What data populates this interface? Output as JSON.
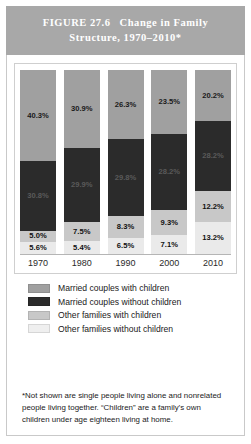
{
  "header": {
    "figure_number": "FIGURE 27.6",
    "title": "Change in Family Structure, 1970–2010*"
  },
  "chart_data": {
    "type": "bar",
    "subtype": "stacked-percent",
    "title": "Change in Family Structure, 1970–2010*",
    "xlabel": "",
    "ylabel": "",
    "ylim": [
      0,
      100
    ],
    "grid": false,
    "legend_position": "below",
    "categories": [
      "1970",
      "1980",
      "1990",
      "2000",
      "2010"
    ],
    "series": [
      {
        "name": "Married couples with children",
        "color": "#a0a0a0",
        "values": [
          40.3,
          30.9,
          26.3,
          23.5,
          20.2
        ],
        "labels": [
          "40.3%",
          "30.9%",
          "26.3%",
          "23.5%",
          "20.2%"
        ]
      },
      {
        "name": "Married couples without children",
        "color": "#2b2b2b",
        "values": [
          30.8,
          29.9,
          29.8,
          28.2,
          28.2
        ],
        "labels": [
          "30.8%",
          "29.9%",
          "29.8%",
          "28.2%",
          "28.2%"
        ]
      },
      {
        "name": "Other families with children",
        "color": "#c8c8c8",
        "values": [
          5.0,
          7.5,
          8.3,
          9.3,
          12.2
        ],
        "labels": [
          "5.0%",
          "7.5%",
          "8.3%",
          "9.3%",
          "12.2%"
        ]
      },
      {
        "name": "Other families without children",
        "color": "#eaeaea",
        "values": [
          5.6,
          5.4,
          6.5,
          7.1,
          13.2
        ],
        "labels": [
          "5.6%",
          "5.4%",
          "6.5%",
          "7.1%",
          "13.2%"
        ]
      }
    ]
  },
  "legend": {
    "items": [
      {
        "label": "Married couples with children"
      },
      {
        "label": "Married couples without children"
      },
      {
        "label": "Other families with children"
      },
      {
        "label": "Other families without children"
      }
    ]
  },
  "footnote": {
    "text": "*Not shown are single people living alone and nonrelated people living together. “Children” are a family’s own children under age eighteen living at home."
  }
}
